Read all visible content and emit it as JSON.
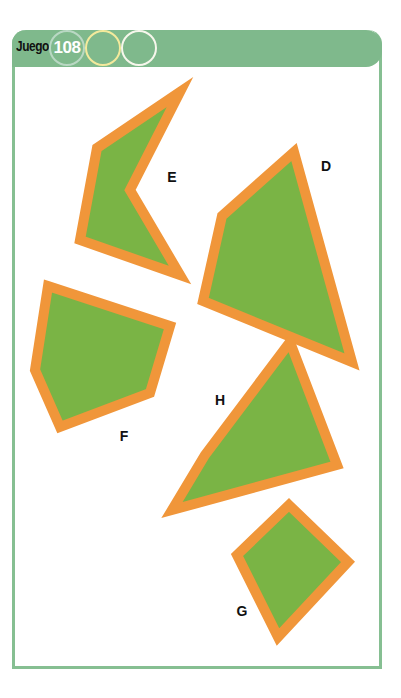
{
  "header": {
    "title": "Juego",
    "game_number": "108",
    "progress_circles": [
      {
        "ring_color": "#b9d8c3"
      },
      {
        "ring_color": "#f4ea9c"
      },
      {
        "ring_color": "#f7f7ec"
      }
    ]
  },
  "colors": {
    "frame": "#86bf92",
    "header_bg": "#7fb98c",
    "shape_fill": "#7ab445",
    "shape_border": "#f0963a"
  },
  "shapes": [
    {
      "label": "E",
      "points": "180,92 97,148 80,240 180,275 130,190",
      "label_pos": [
        172,
        177
      ]
    },
    {
      "label": "D",
      "points": "294,152 222,216 203,301 352,362",
      "label_pos": [
        326,
        166
      ]
    },
    {
      "label": "F",
      "points": "48,286 170,326 150,393 60,427 35,370",
      "label_pos": [
        124,
        436
      ]
    },
    {
      "label": "H",
      "points": "290,342 337,465 172,510 205,455",
      "label_pos": [
        220,
        400
      ]
    },
    {
      "label": "G",
      "points": "289,505 348,562 278,637 237,555",
      "label_pos": [
        242,
        611
      ]
    }
  ]
}
